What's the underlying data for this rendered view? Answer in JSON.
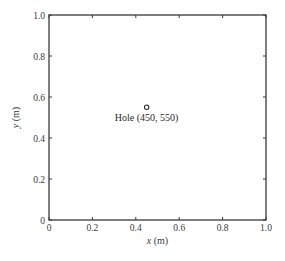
{
  "chart_data": {
    "type": "scatter",
    "title": "",
    "xlabel": "x (m)",
    "ylabel": "y (m)",
    "xlabel_var": "x",
    "xlabel_unit": " (m)",
    "ylabel_var": "y",
    "ylabel_unit": " (m)",
    "xlim": [
      0,
      1.0
    ],
    "ylim": [
      0,
      1.0
    ],
    "grid": false,
    "x_ticks": [
      "0",
      "0.2",
      "0.4",
      "0.6",
      "0.8",
      "1.0"
    ],
    "y_ticks": [
      "0",
      "0.2",
      "0.4",
      "0.6",
      "0.8",
      "1.0"
    ],
    "series": [
      {
        "name": "Hole",
        "marker": "open-circle",
        "points": [
          {
            "x": 0.45,
            "y": 0.55
          }
        ]
      }
    ],
    "annotations": [
      {
        "text": "Hole (450, 550)",
        "x": 0.45,
        "y": 0.55,
        "position": "below"
      }
    ]
  },
  "colors": {
    "axis": "#3a3a3a",
    "marker": "#2a2a2a",
    "background": "#ffffff"
  }
}
